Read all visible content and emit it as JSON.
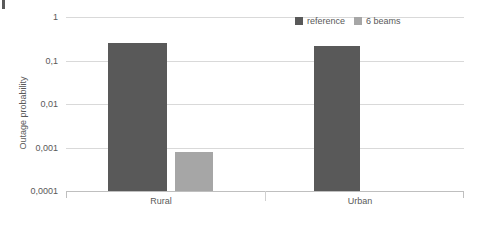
{
  "chart_data": {
    "type": "bar",
    "title": "",
    "subtitle": "",
    "xlabel": "",
    "ylabel": "Outage probability",
    "yscale": "log",
    "ylim": [
      0.0001,
      1
    ],
    "grid": true,
    "legend_position": "top-right",
    "categories": [
      "Rural",
      "Urban"
    ],
    "ytick_labels": [
      "1",
      "0,1",
      "0,01",
      "0,001",
      "0,0001"
    ],
    "ytick_values": [
      1,
      0.1,
      0.01,
      0.001,
      0.0001
    ],
    "series": [
      {
        "name": "reference",
        "color": "#595959",
        "values": [
          0.25,
          0.22
        ]
      },
      {
        "name": "6 beams",
        "color": "#a6a6a6",
        "values": [
          0.0008,
          null
        ]
      }
    ]
  },
  "legend": {
    "items": [
      {
        "label": "reference",
        "color": "#595959"
      },
      {
        "label": "6 beams",
        "color": "#a6a6a6"
      }
    ]
  },
  "axes": {
    "y_title": "Outage probability",
    "y_ticks": [
      "1",
      "0,1",
      "0,01",
      "0,001",
      "0,0001"
    ],
    "x_categories": [
      "Rural",
      "Urban"
    ]
  },
  "colors": {
    "reference": "#595959",
    "six_beams": "#a6a6a6",
    "gridline": "#d9d9d9",
    "axis": "#bfbfbf",
    "text": "#595959",
    "background": "#ffffff"
  }
}
